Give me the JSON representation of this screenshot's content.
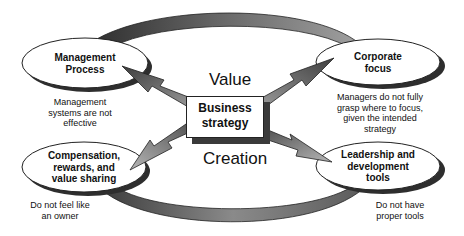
{
  "diagram": {
    "center": {
      "title_line1": "Business",
      "title_line2": "strategy",
      "top_word": "Value",
      "bottom_word": "Creation"
    },
    "nodes": [
      {
        "id": "management-process",
        "label_lines": [
          "Management",
          "Process"
        ],
        "note_lines": [
          "Management",
          "systems are not",
          "effective"
        ]
      },
      {
        "id": "corporate-focus",
        "label_lines": [
          "Corporate",
          "focus"
        ],
        "note_lines": [
          "Managers do not fully",
          "grasp where to focus,",
          "given the intended",
          "strategy"
        ]
      },
      {
        "id": "compensation",
        "label_lines": [
          "Compensation,",
          "rewards, and",
          "value sharing"
        ],
        "note_lines": [
          "Do not feel like",
          "an owner"
        ]
      },
      {
        "id": "leadership",
        "label_lines": [
          "Leadership and",
          "development",
          "tools"
        ],
        "note_lines": [
          "Do not have",
          "proper tools"
        ]
      }
    ],
    "colors": {
      "ring_dark": "#3c3c3c",
      "ring_light": "#9a9a9a",
      "arrow_dark": "#4a4a4a",
      "arrow_light": "#a8a8a8",
      "ellipse_fill": "#ffffff",
      "shadow": "#2e2e2e"
    }
  }
}
